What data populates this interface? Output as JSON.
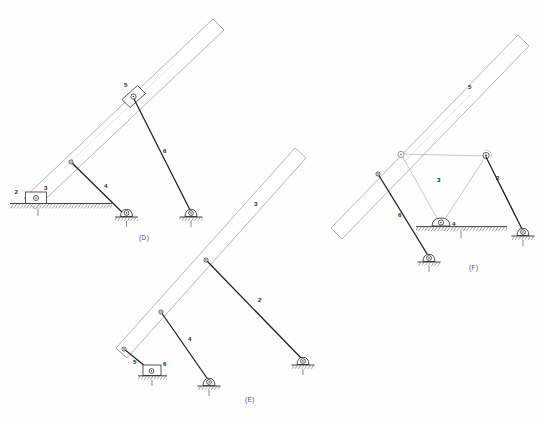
{
  "figure": {
    "background_color": "#fefefe",
    "ink_color": "#2b2b2b",
    "beam_color": "#9b9b9b",
    "caption_color": "#6a4a58",
    "accent_gradient": [
      "#e87fae",
      "#b46fd0",
      "#6fc08a"
    ]
  },
  "captions": {
    "d": "(D)",
    "e": "(E)",
    "f": "(F)"
  },
  "diagrams": [
    {
      "id": "D",
      "caption": "(D)",
      "links": [
        {
          "number": "2",
          "type": "slider-block",
          "note": "slider on ground at left end of beam"
        },
        {
          "number": "3",
          "type": "beam",
          "note": "long inclined bar from ground slider upward right"
        },
        {
          "number": "4",
          "type": "binary-link",
          "note": "from beam point down to pinned support"
        },
        {
          "number": "5",
          "type": "slider-block",
          "note": "block riding on beam midway"
        },
        {
          "number": "6",
          "type": "binary-link",
          "note": "from block 5 down to pinned support"
        }
      ],
      "ground_label": "1",
      "label_values": [
        "2",
        "3",
        "4",
        "5",
        "6"
      ]
    },
    {
      "id": "E",
      "caption": "(E)",
      "links": [
        {
          "number": "2",
          "type": "binary-link",
          "note": "from beam upper point down-right to pinned support"
        },
        {
          "number": "3",
          "type": "beam",
          "note": "long inclined bar"
        },
        {
          "number": "4",
          "type": "binary-link",
          "note": "from beam lower point down to pinned support"
        },
        {
          "number": "5",
          "type": "binary-link",
          "note": "short link from beam end to ground slider"
        },
        {
          "number": "6",
          "type": "slider-block",
          "note": "slider block on ground"
        }
      ],
      "ground_label": "1",
      "label_values": [
        "2",
        "3",
        "4",
        "5",
        "6"
      ]
    },
    {
      "id": "F",
      "caption": "(F)",
      "links": [
        {
          "number": "2",
          "type": "binary-link",
          "note": "from triangle right vertex down to pinned support"
        },
        {
          "number": "3",
          "type": "ternary-link",
          "note": "triangular link, apexes at two top joints and slider 4"
        },
        {
          "number": "4",
          "type": "slider-block",
          "note": "slider block on ground under triangle"
        },
        {
          "number": "5",
          "type": "beam",
          "note": "long inclined bar through left triangle joint"
        },
        {
          "number": "6",
          "type": "binary-link",
          "note": "from beam lower point down to pinned support"
        }
      ],
      "ground_label": "1",
      "label_values": [
        "2",
        "3",
        "4",
        "5",
        "6"
      ]
    }
  ]
}
